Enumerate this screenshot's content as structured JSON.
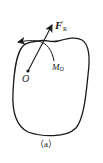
{
  "diagram": {
    "type": "rigid-body-force-system",
    "labels": {
      "resultant_force": "F",
      "resultant_force_prime": "′",
      "resultant_force_sub": "R",
      "moment": "M",
      "moment_sub": "O",
      "point": "O",
      "caption": "（a）"
    },
    "colors": {
      "stroke": "#1a1a1a",
      "background": "#ffffff"
    }
  }
}
